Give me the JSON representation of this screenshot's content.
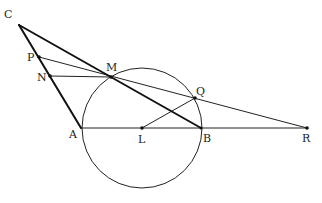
{
  "diagram": {
    "type": "geometry",
    "points": {
      "C": {
        "label": "C",
        "x": 19,
        "y": 25,
        "lx": 4,
        "ly": 18
      },
      "P": {
        "label": "P",
        "x": 39,
        "y": 57,
        "lx": 27,
        "ly": 61
      },
      "N": {
        "label": "N",
        "x": 50,
        "y": 76,
        "lx": 37,
        "ly": 81
      },
      "M": {
        "label": "M",
        "x": 111,
        "y": 77,
        "lx": 106,
        "ly": 71
      },
      "Q": {
        "label": "Q",
        "x": 195,
        "y": 98,
        "lx": 196,
        "ly": 95
      },
      "A": {
        "label": "A",
        "x": 81,
        "y": 128,
        "lx": 69,
        "ly": 138
      },
      "L": {
        "label": "L",
        "x": 142,
        "y": 128,
        "lx": 138,
        "ly": 143
      },
      "B": {
        "label": "B",
        "x": 201,
        "y": 128,
        "lx": 203,
        "ly": 142
      },
      "R": {
        "label": "R",
        "x": 307,
        "y": 128,
        "lx": 302,
        "ly": 142
      }
    },
    "circle": {
      "center": "L",
      "radius": 60
    },
    "segments": [
      {
        "from": "C",
        "to": "A",
        "weight": "thick"
      },
      {
        "from": "C",
        "to": "B",
        "weight": "thick"
      },
      {
        "from": "A",
        "to": "R",
        "weight": "thin"
      },
      {
        "from": "P",
        "to": "R",
        "weight": "thin"
      },
      {
        "from": "N",
        "to": "M",
        "weight": "thin"
      },
      {
        "from": "L",
        "to": "Q",
        "weight": "thin"
      }
    ],
    "marked_points": [
      "P",
      "N",
      "M",
      "Q",
      "L",
      "B",
      "R"
    ]
  }
}
